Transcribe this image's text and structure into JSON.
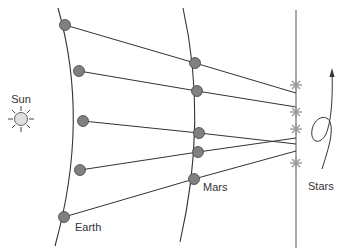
{
  "diagram": {
    "labels": {
      "sun": "Sun",
      "earth": "Earth",
      "mars": "Mars",
      "stars": "Stars"
    },
    "colors": {
      "line": "#333333",
      "planet_dot": "#808080",
      "planet_stroke": "#444444",
      "sun_fill": "#e0e0e0",
      "star": "#9a9a9a"
    },
    "earth_positions": [
      [
        65,
        25
      ],
      [
        79,
        71
      ],
      [
        83,
        121
      ],
      [
        80,
        170
      ],
      [
        64,
        217
      ]
    ],
    "mars_positions": [
      [
        195,
        63
      ],
      [
        197,
        91
      ],
      [
        199,
        133
      ],
      [
        198,
        152
      ],
      [
        194,
        179
      ]
    ],
    "sightline_ends_on_star_line": [
      [
        296,
        93
      ],
      [
        296,
        107
      ],
      [
        296,
        144
      ],
      [
        296,
        138
      ],
      [
        296,
        151
      ]
    ],
    "star_positions": [
      [
        296,
        85
      ],
      [
        296,
        112
      ],
      [
        296,
        129
      ],
      [
        296,
        163
      ]
    ]
  }
}
